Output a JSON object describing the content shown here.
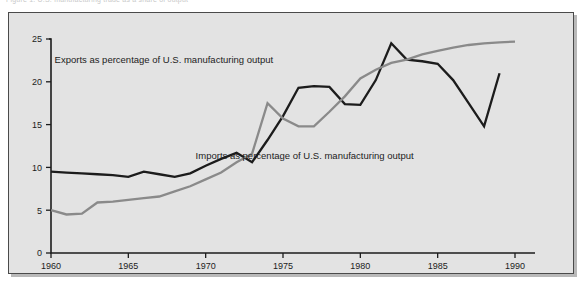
{
  "figure": {
    "caption_remnant": "Figure 1.  U.S. manufacturing trade as a share of output",
    "panel_background": "#e3e3e3",
    "panel_border": "#4a4a4a"
  },
  "chart_data": {
    "type": "line",
    "title": "",
    "xlabel": "",
    "ylabel": "",
    "xlim": [
      1960,
      1990
    ],
    "ylim": [
      0,
      25
    ],
    "grid": false,
    "legend": "inline-annotations",
    "xticks": [
      1960,
      1965,
      1970,
      1975,
      1980,
      1985,
      1990
    ],
    "xtick_labels": [
      "1960",
      "1965",
      "1970",
      "1975",
      "1980",
      "1985",
      "1990"
    ],
    "yticks": [
      0,
      5,
      10,
      15,
      20,
      25
    ],
    "ytick_labels": [
      "0",
      "5",
      "10",
      "15",
      "20",
      "25"
    ],
    "annotations": [
      {
        "text": "Exports as percentage of U.S. manufacturing output",
        "x": 1967.3,
        "y": 22.2
      },
      {
        "text": "Imports as percentage of U.S. manufacturing output",
        "x": 1976.4,
        "y": 11.0
      }
    ],
    "series": [
      {
        "name": "Exports as percentage of U.S. manufacturing output",
        "color": "#1c1c1c",
        "width": 2.3,
        "x": [
          1960,
          1961,
          1962,
          1963,
          1964,
          1965,
          1966,
          1967,
          1968,
          1969,
          1970,
          1971,
          1972,
          1973,
          1974,
          1975,
          1976,
          1977,
          1978,
          1979,
          1980,
          1981,
          1982,
          1983,
          1984,
          1985,
          1986,
          1987,
          1988,
          1989
        ],
        "values": [
          9.5,
          9.4,
          9.3,
          9.2,
          9.1,
          8.9,
          9.5,
          9.2,
          8.9,
          9.3,
          10.2,
          11.0,
          11.7,
          10.6,
          13.2,
          16.0,
          19.3,
          19.5,
          19.4,
          17.4,
          17.3,
          20.2,
          24.5,
          22.6,
          22.4,
          22.1,
          20.2,
          17.5,
          14.8,
          21.0
        ]
      },
      {
        "name": "Imports as percentage of U.S. manufacturing output",
        "color": "#8a8a8a",
        "width": 2.3,
        "x": [
          1960,
          1961,
          1962,
          1963,
          1964,
          1965,
          1966,
          1967,
          1968,
          1969,
          1970,
          1971,
          1972,
          1973,
          1974,
          1975,
          1976,
          1977,
          1978,
          1979,
          1980,
          1981,
          1982,
          1983,
          1984,
          1985,
          1986,
          1987,
          1988,
          1989,
          1990
        ],
        "values": [
          5.0,
          4.5,
          4.6,
          5.9,
          6.0,
          6.2,
          6.4,
          6.6,
          7.2,
          7.8,
          8.6,
          9.4,
          10.6,
          11.6,
          17.5,
          15.7,
          14.8,
          14.8,
          16.5,
          18.3,
          20.4,
          21.4,
          22.2,
          22.6,
          23.2,
          23.6,
          24.0,
          24.3,
          24.5,
          24.6,
          24.7
        ]
      }
    ]
  }
}
